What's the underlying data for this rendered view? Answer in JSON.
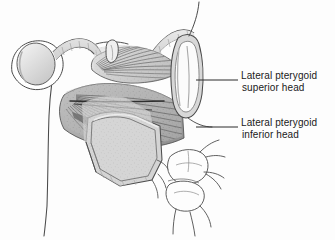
{
  "figure": {
    "type": "anatomical-illustration",
    "style": "grayscale pen-and-ink medical illustration",
    "background_color": "#fdfdfd",
    "ink_color": "#3a3a3a",
    "muscle_fill_light": "#d2d2d2",
    "muscle_fill_mid": "#b4b4b4",
    "muscle_fill_dark": "#8f8f8f",
    "bone_fill": "#ffffff",
    "fiber_stroke": "#6f6f6f"
  },
  "labels": [
    {
      "id": "superior-head",
      "line1": "Lateral pterygoid",
      "line2": "superior head",
      "leader": {
        "x1": 196,
        "y1": 80,
        "x2": 238,
        "y2": 80
      }
    },
    {
      "id": "inferior-head",
      "line1": "Lateral pterygoid",
      "line2": "inferior head",
      "leader": {
        "x1": 196,
        "y1": 127,
        "x2": 238,
        "y2": 127
      }
    }
  ],
  "structures": [
    {
      "id": "mandibular-condyle",
      "name": "mandibular condyle"
    },
    {
      "id": "articular-disc",
      "name": "articular disc"
    },
    {
      "id": "articular-eminence",
      "name": "articular eminence"
    },
    {
      "id": "mandibular-ramus",
      "name": "mandibular ramus"
    },
    {
      "id": "coronoid-process",
      "name": "coronoid process"
    },
    {
      "id": "lateral-pterygoid-plate",
      "name": "lateral pterygoid plate"
    },
    {
      "id": "superior-head-muscle",
      "name": "lateral pterygoid superior head"
    },
    {
      "id": "inferior-head-muscle",
      "name": "lateral pterygoid inferior head"
    },
    {
      "id": "maxillary-molars",
      "name": "maxillary molar teeth"
    },
    {
      "id": "neurovascular-strand",
      "name": "neurovascular strand"
    }
  ]
}
